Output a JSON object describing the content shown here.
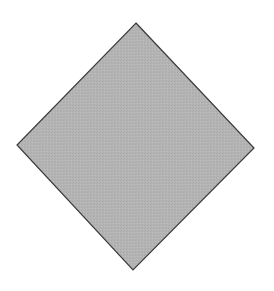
{
  "figure": {
    "shape": {
      "type": "diamond",
      "vertices": {
        "top": [
          136,
          23
        ],
        "right": [
          254,
          148
        ],
        "bottom": [
          133,
          270
        ],
        "left": [
          17,
          145
        ]
      },
      "fill": "#b4b4b4",
      "stroke": "#3a3a3a",
      "stroke_width": 1.2
    },
    "background": "#ffffff"
  }
}
